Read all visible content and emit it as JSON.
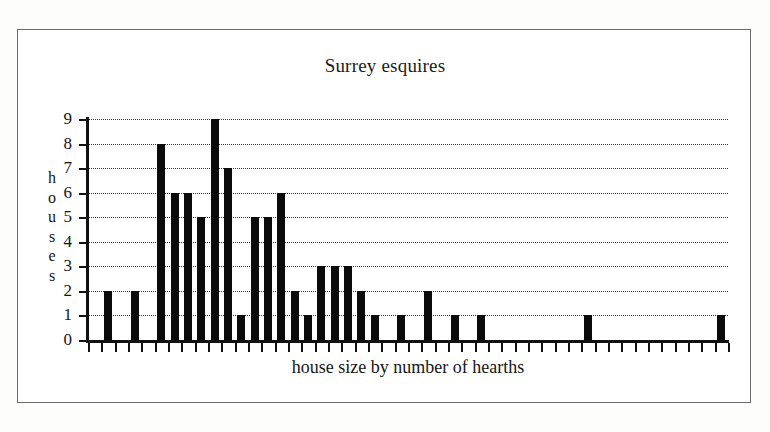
{
  "figure": {
    "border_color": "#6c6c6c",
    "background": "#ffffff"
  },
  "chart_data": {
    "type": "bar",
    "title": "Surrey esquires",
    "xlabel": "house size by number of hearths",
    "ylabel": "houses",
    "ylabel_letters": [
      "h",
      "o",
      "u",
      "s",
      "e",
      "s"
    ],
    "ylim": [
      0,
      9
    ],
    "ytick_labels": [
      "0",
      "1",
      "2",
      "3",
      "4",
      "5",
      "6",
      "7",
      "8",
      "9"
    ],
    "ytick_values": [
      0,
      1,
      2,
      3,
      4,
      5,
      6,
      7,
      8,
      9
    ],
    "grid": "horizontal dotted lines at every integer from 1 to 9",
    "legend": "none",
    "xtick_labels": [],
    "xtick_count": 49,
    "bar_color": "#0a0a0a",
    "note": "x axis has unlabeled evenly spaced ticks; bars occupy the interval between ticks. Zero-height entries are empty slots.",
    "categories": [
      1,
      2,
      3,
      4,
      5,
      6,
      7,
      8,
      9,
      10,
      11,
      12,
      13,
      14,
      15,
      16,
      17,
      18,
      19,
      20,
      21,
      22,
      23,
      24,
      25,
      26,
      27,
      28,
      29,
      30,
      31,
      32,
      33,
      34,
      35,
      36,
      37,
      38,
      39,
      40,
      41,
      42,
      43,
      44,
      45,
      46,
      47,
      48
    ],
    "values": [
      0,
      2,
      0,
      2,
      0,
      8,
      6,
      6,
      5,
      9,
      7,
      1,
      5,
      5,
      6,
      2,
      1,
      3,
      3,
      3,
      2,
      1,
      0,
      1,
      0,
      2,
      0,
      1,
      0,
      1,
      0,
      0,
      0,
      0,
      0,
      0,
      0,
      1,
      0,
      0,
      0,
      0,
      0,
      0,
      0,
      0,
      0,
      1
    ]
  }
}
